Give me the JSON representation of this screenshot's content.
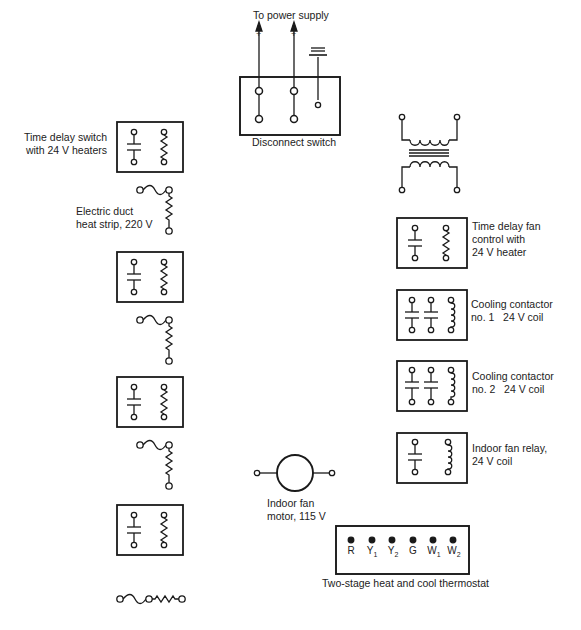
{
  "power_supply": {
    "label": "To power supply",
    "terminals": [
      "+",
      "+",
      "ground"
    ]
  },
  "disconnect_switch": {
    "label": "Disconnect switch"
  },
  "transformer": {
    "label": ""
  },
  "left_column": {
    "time_delay_switch": {
      "label": "Time delay switch\nwith 24 V heaters"
    },
    "heat_strip": {
      "label": "Electric duct\nheat strip, 220 V"
    },
    "relay_count": 4,
    "heat_strip_count": 4
  },
  "right_column": {
    "time_delay_fan": {
      "label": "Time delay fan\ncontrol with\n24 V heater"
    },
    "cooling_contactor_1": {
      "label": "Cooling contactor\nno. 1   24 V coil"
    },
    "cooling_contactor_2": {
      "label": "Cooling contactor\nno. 2   24 V coil"
    },
    "indoor_fan_relay": {
      "label": "Indoor fan relay,\n24 V coil"
    }
  },
  "indoor_fan_motor": {
    "label": "Indoor fan\nmotor, 115 V"
  },
  "thermostat": {
    "label": "Two-stage heat and cool thermostat",
    "terminals": [
      {
        "base": "R",
        "sub": ""
      },
      {
        "base": "Y",
        "sub": "1"
      },
      {
        "base": "Y",
        "sub": "2"
      },
      {
        "base": "G",
        "sub": ""
      },
      {
        "base": "W",
        "sub": "1"
      },
      {
        "base": "W",
        "sub": "2"
      }
    ]
  },
  "colors": {
    "ink": "#1a1a1a",
    "background": "#ffffff"
  }
}
